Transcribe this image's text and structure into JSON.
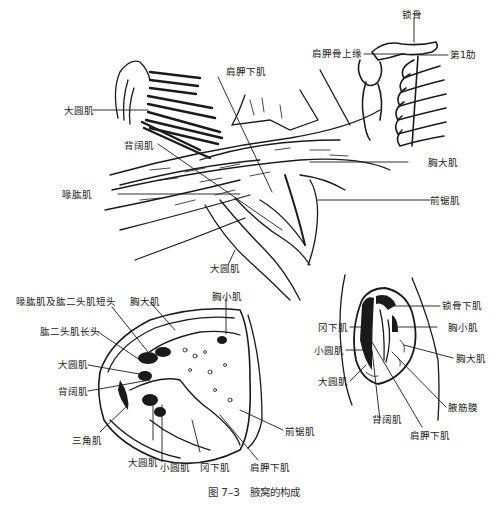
{
  "caption": "图 7–3　腋窝的构成",
  "colors": {
    "ink": "#1a1a1a",
    "paper": "#ffffff"
  },
  "top_figure": {
    "labels": {
      "clavicle": "锁骨",
      "scapula_superior_border": "肩胛骨上缘",
      "first_rib": "第1肋",
      "subscapularis": "肩胛下肌",
      "teres_major": "大圆肌",
      "latissimus_dorsi": "背阔肌",
      "pectoralis_major": "胸大肌",
      "coracobrachialis": "喙肱肌",
      "serratus_anterior": "前锯肌",
      "teres_major_lower": "大圆肌"
    }
  },
  "left_section": {
    "labels": {
      "coracobrachialis_biceps_short": "喙肱肌及肱二头肌短头",
      "pectoralis_major": "胸大肌",
      "pectoralis_minor": "胸小肌",
      "biceps_long": "肱二头肌长头",
      "teres_major": "大圆肌",
      "latissimus_dorsi": "背阔肌",
      "deltoid": "三角肌",
      "teres_major_bottom": "大圆肌",
      "teres_minor": "小圆肌",
      "infraspinatus": "冈下肌",
      "subscapularis": "肩胛下肌",
      "serratus_anterior": "前锯肌"
    }
  },
  "right_section": {
    "labels": {
      "subclavius": "锁骨下肌",
      "pectoralis_minor": "胸小肌",
      "pectoralis_major": "胸大肌",
      "axillary_fascia": "腋筋膜",
      "subscapularis": "肩胛下肌",
      "latissimus_dorsi": "背阔肌",
      "infraspinatus": "冈下肌",
      "teres_minor": "小圆肌",
      "teres_major": "大圆肌"
    }
  }
}
